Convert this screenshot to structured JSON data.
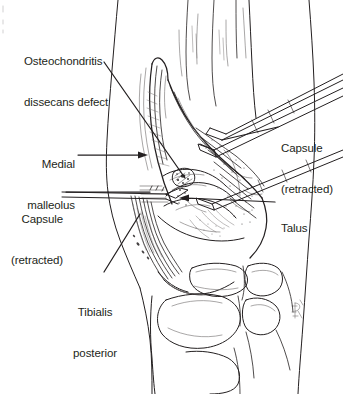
{
  "figure": {
    "kind": "medical-illustration",
    "view": "anterior-medial surgical exposure of right ankle",
    "style": "black and white pen-and-ink line drawing",
    "background_color": "#ffffff",
    "ink_color": "#231f20"
  },
  "labels": [
    {
      "id": "osteochondritis-dissecans-defect",
      "text_line1": "Osteochondritis",
      "text_line2": "dissecans defect",
      "align": "left",
      "leader": "long diagonal line running down-right from label to the defect on the talar dome"
    },
    {
      "id": "medial-malleolus",
      "text_line1": "Medial",
      "text_line2": "malleolus",
      "align": "right",
      "leader": "horizontal arrow pointing right to the medial malleolus"
    },
    {
      "id": "capsule-retracted-left",
      "text_line1": "Capsule",
      "text_line2": "(retracted)",
      "align": "right",
      "leader": "horizontal line running right to the retracted anterior capsule flap"
    },
    {
      "id": "tibialis-posterior",
      "text_line1": "Tibialis",
      "text_line2": "posterior",
      "align": "center",
      "leader": "diagonal line running up-right to the tibialis posterior tendon"
    },
    {
      "id": "capsule-retracted-right",
      "text_line1": "Capsule",
      "text_line2": "(retracted)",
      "align": "left",
      "leader": "diagonal line running up-left to the retractor holding the capsule"
    },
    {
      "id": "talus",
      "text_line1": "Talus",
      "text_line2": "",
      "align": "left",
      "leader": "horizontal arrow pointing left to the talar body"
    }
  ],
  "artist_signature": {
    "present": true,
    "description": "small hand-drawn monogram at lower right of the drawing"
  }
}
